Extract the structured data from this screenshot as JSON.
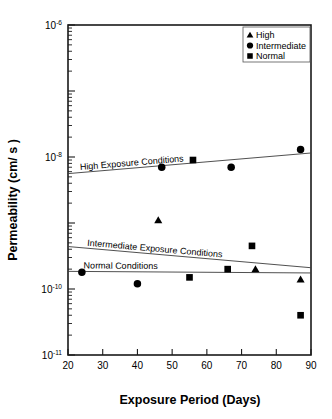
{
  "chart_data": {
    "type": "scatter",
    "title": "",
    "xlabel": "Exposure Period (Days)",
    "ylabel": "Permeability (cm/ s )",
    "xlim": [
      20,
      90
    ],
    "ylim": [
      1e-11,
      1e-06
    ],
    "yscale": "log",
    "xscale": "linear",
    "grid": false,
    "xticks": [
      20,
      30,
      40,
      50,
      60,
      70,
      80,
      90
    ],
    "xticklabels": [
      "20",
      "30",
      "40",
      "50",
      "60",
      "70",
      "80",
      "90"
    ],
    "yticks": [
      1e-06,
      1e-08,
      1e-10,
      1e-11
    ],
    "yticklabels": [
      "10-6",
      "10-8",
      "10-10",
      "10-11"
    ],
    "ytick_mantissas": [
      "10",
      "10",
      "10",
      "10"
    ],
    "ytick_exponents": [
      "-6",
      "-8",
      "-10",
      "-11"
    ],
    "legend_position": "top-right",
    "series": [
      {
        "name": "High",
        "marker": "triangle",
        "color": "#000000",
        "points": [
          {
            "x": 46,
            "y": 1.1e-09
          },
          {
            "x": 74,
            "y": 2e-10
          },
          {
            "x": 87,
            "y": 1.4e-10
          }
        ]
      },
      {
        "name": "Intermediate",
        "marker": "circle",
        "color": "#000000",
        "points": [
          {
            "x": 24,
            "y": 1.8e-10
          },
          {
            "x": 40,
            "y": 1.2e-10
          },
          {
            "x": 47,
            "y": 7e-09
          },
          {
            "x": 67,
            "y": 7e-09
          },
          {
            "x": 87,
            "y": 1.3e-08
          }
        ]
      },
      {
        "name": "Normal",
        "marker": "square",
        "color": "#000000",
        "points": [
          {
            "x": 56,
            "y": 9e-09
          },
          {
            "x": 55,
            "y": 1.5e-10
          },
          {
            "x": 66,
            "y": 2e-10
          },
          {
            "x": 73,
            "y": 4.5e-10
          },
          {
            "x": 87,
            "y": 4e-11
          }
        ]
      }
    ],
    "trendlines": [
      {
        "label": "High Exposure Conditions",
        "x0": 20,
        "y0": 5.6e-09,
        "x1": 90,
        "y1": 1.15e-08
      },
      {
        "label": "Intermediate Exposure Conditions",
        "x0": 20,
        "y0": 4.4e-10,
        "x1": 90,
        "y1": 2.1e-10
      },
      {
        "label": "Normal Conditions",
        "x0": 20,
        "y0": 1.85e-10,
        "x1": 90,
        "y1": 1.75e-10
      }
    ]
  },
  "legend": {
    "items": [
      {
        "label": "High",
        "marker": "triangle"
      },
      {
        "label": "Intermediate",
        "marker": "circle"
      },
      {
        "label": "Normal",
        "marker": "square"
      }
    ]
  }
}
